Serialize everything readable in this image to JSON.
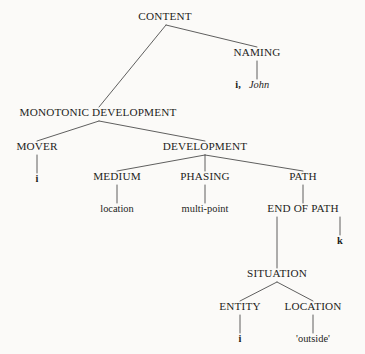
{
  "diagram": {
    "type": "tree",
    "background_color": "#fbfaf8",
    "text_color": "#1d1d1b",
    "line_color": "#4d4d4d",
    "nodes": {
      "content": {
        "label": "CONTENT",
        "kind": "category",
        "x": 165,
        "y": 20
      },
      "naming": {
        "label": "NAMING",
        "kind": "category",
        "x": 257,
        "y": 56
      },
      "naming_lex_index": {
        "label": "i,",
        "kind": "lexical-bold",
        "x": 238,
        "y": 88
      },
      "naming_lex_word": {
        "label": "John",
        "kind": "lexical-italic",
        "x": 259,
        "y": 88
      },
      "monotonic_development": {
        "label": "MONOTONIC DEVELOPMENT",
        "kind": "category",
        "x": 98,
        "y": 116
      },
      "mover": {
        "label": "MOVER",
        "kind": "category",
        "x": 37,
        "y": 150
      },
      "mover_lex": {
        "label": "i",
        "kind": "lexical-bold",
        "x": 37,
        "y": 182
      },
      "development": {
        "label": "DEVELOPMENT",
        "kind": "category",
        "x": 205,
        "y": 150
      },
      "medium": {
        "label": "MEDIUM",
        "kind": "category",
        "x": 117,
        "y": 180
      },
      "medium_lex": {
        "label": "location",
        "kind": "lexical",
        "x": 117,
        "y": 212
      },
      "phasing": {
        "label": "PHASING",
        "kind": "category",
        "x": 205,
        "y": 180
      },
      "phasing_lex": {
        "label": "multi-point",
        "kind": "lexical",
        "x": 205,
        "y": 212
      },
      "path": {
        "label": "PATH",
        "kind": "category",
        "x": 303,
        "y": 180
      },
      "end_of_path": {
        "label": "END OF PATH",
        "kind": "category",
        "x": 303,
        "y": 212
      },
      "end_of_path_lex": {
        "label": "k",
        "kind": "lexical-bold",
        "x": 340,
        "y": 244
      },
      "situation": {
        "label": "SITUATION",
        "kind": "category",
        "x": 277,
        "y": 277
      },
      "entity": {
        "label": "ENTITY",
        "kind": "category",
        "x": 240,
        "y": 310
      },
      "entity_lex": {
        "label": "i",
        "kind": "lexical-bold",
        "x": 240,
        "y": 342
      },
      "location": {
        "label": "LOCATION",
        "kind": "category",
        "x": 313,
        "y": 310
      },
      "location_lex": {
        "label": "'outside'",
        "kind": "lexical",
        "x": 313,
        "y": 342
      }
    },
    "edges": [
      {
        "from": "content",
        "to": "naming",
        "x1": 166,
        "y1": 25,
        "x2": 257,
        "y2": 47
      },
      {
        "from": "content",
        "to": "monotonic_development",
        "x1": 166,
        "y1": 25,
        "x2": 99,
        "y2": 107
      },
      {
        "from": "naming",
        "to": "naming_lex",
        "x1": 257,
        "y1": 61,
        "x2": 257,
        "y2": 79
      },
      {
        "from": "monotonic_development",
        "to": "mover",
        "x1": 99,
        "y1": 121,
        "x2": 37,
        "y2": 141
      },
      {
        "from": "monotonic_development",
        "to": "development",
        "x1": 99,
        "y1": 121,
        "x2": 205,
        "y2": 141
      },
      {
        "from": "mover",
        "to": "mover_lex",
        "x1": 37,
        "y1": 155,
        "x2": 37,
        "y2": 173
      },
      {
        "from": "development",
        "to": "medium",
        "x1": 205,
        "y1": 155,
        "x2": 117,
        "y2": 171
      },
      {
        "from": "development",
        "to": "phasing",
        "x1": 205,
        "y1": 155,
        "x2": 205,
        "y2": 171
      },
      {
        "from": "development",
        "to": "path",
        "x1": 205,
        "y1": 155,
        "x2": 303,
        "y2": 171
      },
      {
        "from": "medium",
        "to": "medium_lex",
        "x1": 117,
        "y1": 185,
        "x2": 117,
        "y2": 203
      },
      {
        "from": "phasing",
        "to": "phasing_lex",
        "x1": 205,
        "y1": 185,
        "x2": 205,
        "y2": 203
      },
      {
        "from": "path",
        "to": "end_of_path",
        "x1": 303,
        "y1": 185,
        "x2": 303,
        "y2": 203
      },
      {
        "from": "end_of_path",
        "to": "end_of_path_lex",
        "x1": 340,
        "y1": 217,
        "x2": 340,
        "y2": 235
      },
      {
        "from": "end_of_path",
        "to": "situation",
        "x1": 277,
        "y1": 217,
        "x2": 277,
        "y2": 268
      },
      {
        "from": "situation",
        "to": "entity",
        "x1": 277,
        "y1": 282,
        "x2": 240,
        "y2": 301
      },
      {
        "from": "situation",
        "to": "location",
        "x1": 277,
        "y1": 282,
        "x2": 313,
        "y2": 301
      },
      {
        "from": "entity",
        "to": "entity_lex",
        "x1": 240,
        "y1": 315,
        "x2": 240,
        "y2": 333
      },
      {
        "from": "location",
        "to": "location_lex",
        "x1": 313,
        "y1": 315,
        "x2": 313,
        "y2": 333
      }
    ]
  }
}
